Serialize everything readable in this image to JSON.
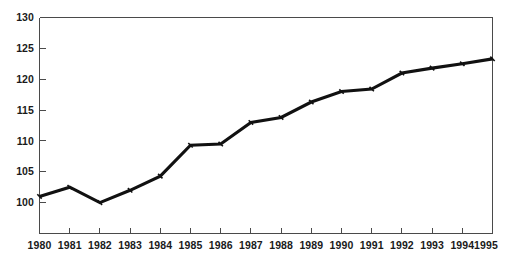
{
  "chart_data": {
    "type": "line",
    "title": "",
    "xlabel": "",
    "ylabel": "",
    "categories": [
      "1980",
      "1981",
      "1982",
      "1983",
      "1984",
      "1985",
      "1986",
      "1987",
      "1988",
      "1989",
      "1990",
      "1991",
      "1992",
      "1993",
      "1994",
      "1995"
    ],
    "values": [
      101.0,
      102.5,
      100.0,
      102.0,
      104.3,
      109.3,
      109.5,
      113.0,
      113.8,
      116.3,
      118.0,
      118.4,
      121.0,
      121.8,
      122.5,
      123.3
    ],
    "series": [
      {
        "name": "index",
        "values": [
          101.0,
          102.5,
          100.0,
          102.0,
          104.3,
          109.3,
          109.5,
          113.0,
          113.8,
          116.3,
          118.0,
          118.4,
          121.0,
          121.8,
          122.5,
          123.3
        ]
      }
    ],
    "ytick_labels": [
      "130",
      "125",
      "120",
      "115",
      "110",
      "105",
      "100"
    ],
    "ytick_values": [
      130,
      125,
      120,
      115,
      110,
      105,
      100
    ],
    "ylim": [
      95,
      130
    ],
    "xlim": [
      "1980",
      "1995"
    ],
    "grid": false,
    "legend": false,
    "legend_position": "none",
    "line_color": "#111111",
    "axis_color": "#4a4a4a",
    "background_color": "#ffffff",
    "markers": true,
    "annotations": []
  }
}
